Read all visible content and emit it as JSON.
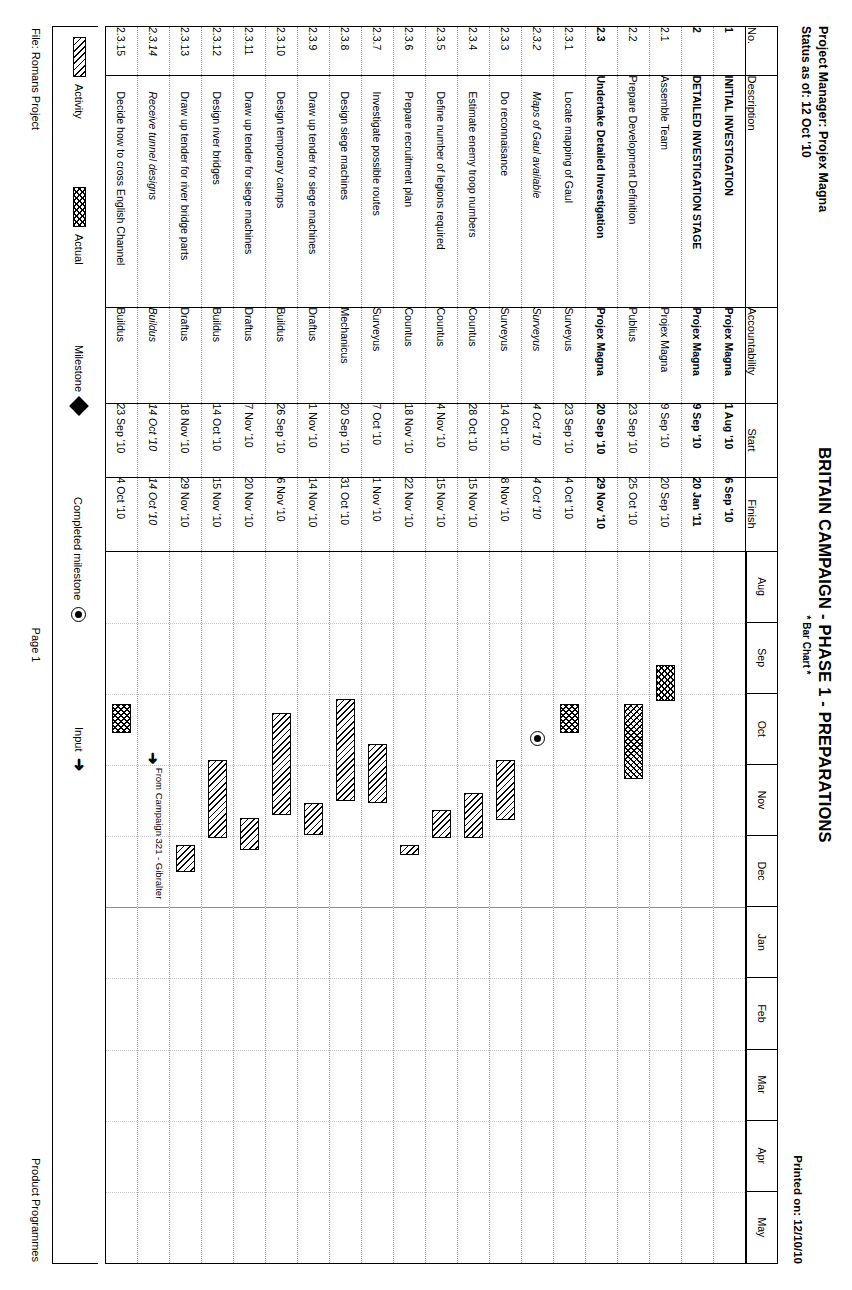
{
  "header": {
    "project_manager": "Project Manager: Projex Magna",
    "status_as_of": "Status as of: 12 Oct '10",
    "title": "BRITAIN CAMPAIGN - PHASE 1 - PREPARATIONS",
    "subtitle": "* Bar Chart *",
    "printed_on": "Printed on: 12/10/10"
  },
  "columns": {
    "no": "No.",
    "description": "Description",
    "accountability": "Accountability",
    "start": "Start",
    "finish": "Finish"
  },
  "timeline": {
    "months": [
      "Aug",
      "Sep",
      "Oct",
      "Nov",
      "Dec",
      "Jan",
      "Feb",
      "Mar",
      "Apr",
      "May"
    ],
    "year_break_after": "Dec"
  },
  "rows": [
    {
      "no": "1",
      "description": "INITIAL INVESTIGATION",
      "accountability": "Projex Magna",
      "start": "1 Aug '10",
      "finish": "6 Sep '10",
      "level": 0,
      "style": "bold"
    },
    {
      "no": "2",
      "description": "DETAILED INVESTIGATION STAGE",
      "accountability": "Projex Magna",
      "start": "9 Sep '10",
      "finish": "20 Jan '11",
      "level": 0,
      "style": "bold"
    },
    {
      "no": "2.1",
      "description": "Assemble Team",
      "accountability": "Projex Magna",
      "start": "9 Sep '10",
      "finish": "20 Sep '10",
      "level": 1,
      "style": "normal"
    },
    {
      "no": "2.2",
      "description": "Prepare Development Definition",
      "accountability": "Publius",
      "start": "23 Sep '10",
      "finish": "25 Oct '10",
      "level": 1,
      "style": "normal"
    },
    {
      "no": "2.3",
      "description": "Undertake Detailed Investigation",
      "accountability": "Projex Magna",
      "start": "20 Sep '10",
      "finish": "29 Nov '10",
      "level": 1,
      "style": "bold"
    },
    {
      "no": "2.3.1",
      "description": "Locate mapping of Gaul",
      "accountability": "Surveyus",
      "start": "23 Sep '10",
      "finish": "4 Oct '10",
      "level": 2,
      "style": "normal"
    },
    {
      "no": "2.3.2",
      "description": "Maps of Gaul available",
      "accountability": "Surveyus",
      "start": "4 Oct '10",
      "finish": "4 Oct '10",
      "level": 2,
      "style": "italic"
    },
    {
      "no": "2.3.3",
      "description": "Do reconnaisance",
      "accountability": "Surveyus",
      "start": "14 Oct '10",
      "finish": "8 Nov '10",
      "level": 2,
      "style": "normal"
    },
    {
      "no": "2.3.4",
      "description": "Estimate enemy troop numbers",
      "accountability": "Countus",
      "start": "28 Oct '10",
      "finish": "15 Nov '10",
      "level": 2,
      "style": "normal"
    },
    {
      "no": "2.3.5",
      "description": "Define number of legions required",
      "accountability": "Countus",
      "start": "4 Nov '10",
      "finish": "15 Nov '10",
      "level": 2,
      "style": "normal"
    },
    {
      "no": "2.3.6",
      "description": "Prepare recruitment plan",
      "accountability": "Countus",
      "start": "18 Nov '10",
      "finish": "22 Nov '10",
      "level": 2,
      "style": "normal"
    },
    {
      "no": "2.3.7",
      "description": "Investigate possible routes",
      "accountability": "Surveyus",
      "start": "7 Oct '10",
      "finish": "1 Nov '10",
      "level": 2,
      "style": "normal"
    },
    {
      "no": "2.3.8",
      "description": "Design siege machines",
      "accountability": "Mechanicus",
      "start": "20 Sep '10",
      "finish": "31 Oct '10",
      "level": 2,
      "style": "normal"
    },
    {
      "no": "2.3.9",
      "description": "Draw up tender for siege machines",
      "accountability": "Draftus",
      "start": "1 Nov '10",
      "finish": "14 Nov '10",
      "level": 2,
      "style": "normal"
    },
    {
      "no": "2.3.10",
      "description": "Design temporary camps",
      "accountability": "Buildus",
      "start": "26 Sep '10",
      "finish": "6 Nov '10",
      "level": 2,
      "style": "normal"
    },
    {
      "no": "2.3.11",
      "description": "Draw up tender for siege machines",
      "accountability": "Draftus",
      "start": "7 Nov '10",
      "finish": "20 Nov '10",
      "level": 2,
      "style": "normal"
    },
    {
      "no": "2.3.12",
      "description": "Design river bridges",
      "accountability": "Buildus",
      "start": "14 Oct '10",
      "finish": "15 Nov '10",
      "level": 2,
      "style": "normal"
    },
    {
      "no": "2.3.13",
      "description": "Draw up tender for river bridge parts",
      "accountability": "Draftus",
      "start": "18 Nov '10",
      "finish": "29 Nov '10",
      "level": 2,
      "style": "normal"
    },
    {
      "no": "2.3.14",
      "description": "Receive tunnel designs",
      "accountability": "Buildus",
      "start": "14 Oct '10",
      "finish": "14 Oct '10",
      "level": 2,
      "style": "italic"
    },
    {
      "no": "2.3.15",
      "description": "Decide how to cross English Channel",
      "accountability": "Buildus",
      "start": "23 Sep '10",
      "finish": "4 Oct '10",
      "level": 2,
      "style": "normal"
    }
  ],
  "chart_data": {
    "type": "bar",
    "title": "BRITAIN CAMPAIGN - PHASE 1 - PREPARATIONS",
    "subtitle": "* Bar Chart *",
    "xlabel": "",
    "ylabel": "",
    "axis_months": [
      "Aug",
      "Sep",
      "Oct",
      "Nov",
      "Dec",
      "Jan",
      "Feb",
      "Mar",
      "Apr",
      "May"
    ],
    "grid": true,
    "legend_position": "bottom",
    "bars": [
      {
        "no": "1",
        "kind": "none",
        "start": "1 Aug '10",
        "finish": "6 Sep '10"
      },
      {
        "no": "2",
        "kind": "none",
        "start": "9 Sep '10",
        "finish": "20 Jan '11"
      },
      {
        "no": "2.1",
        "kind": "actual",
        "start": "9 Sep '10",
        "finish": "20 Sep '10",
        "start_pct": 16.0,
        "end_pct": 21.0
      },
      {
        "no": "2.2",
        "kind": "actual",
        "start": "23 Sep '10",
        "finish": "25 Oct '10",
        "start_pct": 21.5,
        "end_pct": 32.0
      },
      {
        "no": "2.3",
        "kind": "none",
        "start": "20 Sep '10",
        "finish": "29 Nov '10"
      },
      {
        "no": "2.3.1",
        "kind": "actual",
        "start": "23 Sep '10",
        "finish": "4 Oct '10",
        "start_pct": 21.5,
        "end_pct": 25.5
      },
      {
        "no": "2.3.2",
        "kind": "milestone-done",
        "start": "4 Oct '10",
        "finish": "4 Oct '10",
        "start_pct": 26.2,
        "end_pct": 26.2
      },
      {
        "no": "2.3.3",
        "kind": "activity",
        "start": "14 Oct '10",
        "finish": "8 Nov '10",
        "start_pct": 29.3,
        "end_pct": 37.8
      },
      {
        "no": "2.3.4",
        "kind": "activity",
        "start": "28 Oct '10",
        "finish": "15 Nov '10",
        "start_pct": 34.0,
        "end_pct": 40.2
      },
      {
        "no": "2.3.5",
        "kind": "activity",
        "start": "4 Nov '10",
        "finish": "15 Nov '10",
        "start_pct": 36.4,
        "end_pct": 40.2
      },
      {
        "no": "2.3.6",
        "kind": "activity",
        "start": "18 Nov '10",
        "finish": "22 Nov '10",
        "start_pct": 41.2,
        "end_pct": 42.7
      },
      {
        "no": "2.3.7",
        "kind": "activity",
        "start": "7 Oct '10",
        "finish": "1 Nov '10",
        "start_pct": 27.0,
        "end_pct": 35.4
      },
      {
        "no": "2.3.8",
        "kind": "activity",
        "start": "20 Sep '10",
        "finish": "31 Oct '10",
        "start_pct": 20.7,
        "end_pct": 35.1
      },
      {
        "no": "2.3.9",
        "kind": "activity",
        "start": "1 Nov '10",
        "finish": "14 Nov '10",
        "start_pct": 35.4,
        "end_pct": 39.9
      },
      {
        "no": "2.3.10",
        "kind": "activity",
        "start": "26 Sep '10",
        "finish": "6 Nov '10",
        "start_pct": 22.7,
        "end_pct": 37.1
      },
      {
        "no": "2.3.11",
        "kind": "activity",
        "start": "7 Nov '10",
        "finish": "20 Nov '10",
        "start_pct": 37.4,
        "end_pct": 41.9
      },
      {
        "no": "2.3.12",
        "kind": "activity",
        "start": "14 Oct '10",
        "finish": "15 Nov '10",
        "start_pct": 29.3,
        "end_pct": 40.2
      },
      {
        "no": "2.3.13",
        "kind": "activity",
        "start": "18 Nov '10",
        "finish": "29 Nov '10",
        "start_pct": 41.2,
        "end_pct": 45.0
      },
      {
        "no": "2.3.14",
        "kind": "input",
        "start": "14 Oct '10",
        "finish": "14 Oct '10",
        "start_pct": 29.0,
        "end_pct": 29.0,
        "annotation": "From Campaign 321 - Gibralter"
      },
      {
        "no": "2.3.15",
        "kind": "actual",
        "start": "23 Sep '10",
        "finish": "4 Oct '10",
        "start_pct": 21.5,
        "end_pct": 25.5
      }
    ]
  },
  "legend": {
    "activity": "Activity",
    "actual": "Actual",
    "milestone": "Milestone",
    "completed_milestone": "Completed milestone",
    "input": "Input"
  },
  "footer": {
    "file": "File: Romans Project",
    "page": "Page 1",
    "org": "Product Programmes"
  },
  "annotations": {
    "from_campaign": "From Campaign 321 - Gibralter"
  }
}
